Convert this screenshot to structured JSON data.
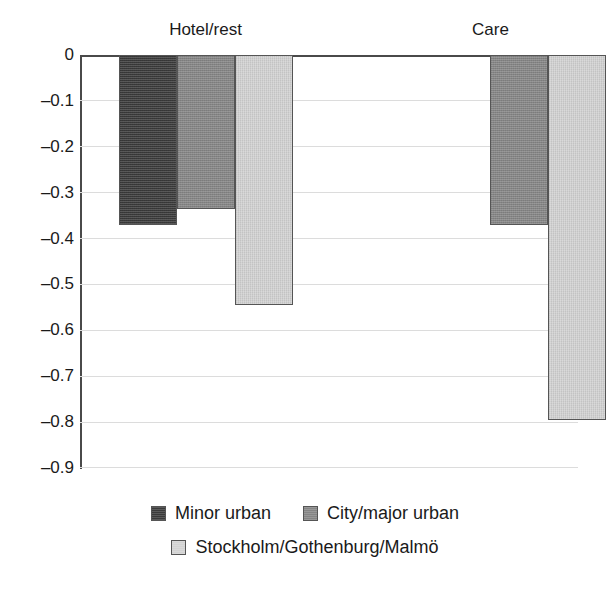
{
  "chart_data": {
    "type": "bar",
    "title": "",
    "subtitle": "",
    "xlabel": "",
    "ylabel": "",
    "categories": [
      "Hotel/rest",
      "Care"
    ],
    "series": [
      {
        "name": "Minor urban",
        "color": "#3a3a3a",
        "values": [
          -0.37,
          null
        ]
      },
      {
        "name": "City/major urban",
        "color": "#858585",
        "values": [
          -0.335,
          -0.37
        ]
      },
      {
        "name": "Stockholm/Gothenburg/Malmö",
        "color": "#d2d2d2",
        "values": [
          -0.545,
          -0.795
        ]
      }
    ],
    "ylim": [
      -0.9,
      0
    ],
    "ytick_values": [
      0,
      -0.1,
      -0.2,
      -0.3,
      -0.4,
      -0.5,
      -0.6,
      -0.7,
      -0.8,
      -0.9
    ],
    "ytick_labels": [
      "0",
      "–0.1",
      "–0.2",
      "–0.3",
      "–0.4",
      "–0.5",
      "–0.6",
      "–0.7",
      "–0.8",
      "–0.9"
    ],
    "grid": true,
    "grid_axis": "y",
    "legend_position": "bottom",
    "orientation": "vertical"
  },
  "axis": {
    "ticks": [
      {
        "label": "0"
      },
      {
        "label": "–0.1"
      },
      {
        "label": "–0.2"
      },
      {
        "label": "–0.3"
      },
      {
        "label": "–0.4"
      },
      {
        "label": "–0.5"
      },
      {
        "label": "–0.6"
      },
      {
        "label": "–0.7"
      },
      {
        "label": "–0.8"
      },
      {
        "label": "–0.9"
      }
    ]
  },
  "groups": [
    {
      "label": "Hotel/rest"
    },
    {
      "label": "Care"
    }
  ],
  "legend": {
    "items": [
      {
        "label": "Minor urban",
        "color": "#3a3a3a"
      },
      {
        "label": "City/major urban",
        "color": "#858585"
      },
      {
        "label": "Stockholm/Gothenburg/Malmö",
        "color": "#d2d2d2"
      }
    ]
  }
}
